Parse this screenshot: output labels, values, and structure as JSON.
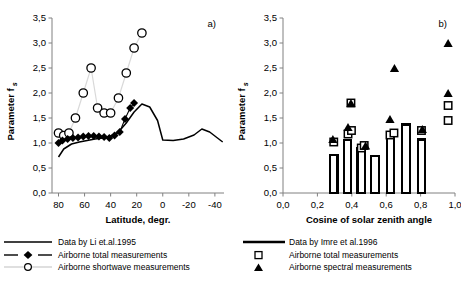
{
  "figure": {
    "panel_a_label": "a)",
    "panel_b_label": "b)"
  },
  "chart_data": [
    {
      "type": "scatter",
      "panel": "a)",
      "title": "",
      "xlabel": "Latitude, degr.",
      "ylabel": "Parameter f",
      "ylabel_sub": "s",
      "xlim": [
        85,
        -47
      ],
      "ylim": [
        0.0,
        3.5
      ],
      "xticks": [
        80,
        60,
        40,
        20,
        0,
        -20,
        -40
      ],
      "xticklabels": [
        "80",
        "60",
        "40",
        "20",
        "0",
        "-20",
        "-40"
      ],
      "yticks": [
        0.0,
        0.5,
        1.0,
        1.5,
        2.0,
        2.5,
        3.0,
        3.5
      ],
      "yticklabels": [
        "0,0",
        "0,5",
        "1,0",
        "1,5",
        "2,0",
        "2,5",
        "3,0",
        "3,5"
      ],
      "grid": false,
      "legend_position": "below",
      "series": [
        {
          "name": "Data by Li et.al.1995",
          "style": "line",
          "color": "#000000",
          "x": [
            80,
            76,
            70,
            64,
            58,
            52,
            46,
            40,
            34,
            28,
            22,
            16,
            10,
            4,
            0,
            -8,
            -16,
            -24,
            -30,
            -36,
            -42,
            -46
          ],
          "values": [
            0.72,
            0.88,
            0.98,
            1.02,
            1.05,
            1.08,
            1.1,
            1.14,
            1.22,
            1.4,
            1.62,
            1.78,
            1.72,
            1.45,
            1.06,
            1.05,
            1.08,
            1.16,
            1.28,
            1.22,
            1.1,
            1.02
          ]
        },
        {
          "name": "Airborne total measurements",
          "style": "line-diamond",
          "color": "#000000",
          "x": [
            80,
            77,
            73,
            69,
            65,
            61,
            57,
            53,
            49,
            45,
            41,
            37,
            33,
            29,
            25,
            22
          ],
          "values": [
            1.0,
            1.05,
            1.08,
            1.1,
            1.11,
            1.13,
            1.14,
            1.14,
            1.13,
            1.12,
            1.1,
            1.15,
            1.22,
            1.48,
            1.7,
            1.8
          ]
        },
        {
          "name": "Airborne shortwave measurements",
          "style": "line-circle",
          "color": "#bfbfbf",
          "x": [
            80,
            76,
            72,
            67,
            61,
            55,
            50,
            45,
            40,
            34,
            28,
            22
          ],
          "values": [
            1.2,
            1.15,
            1.2,
            1.5,
            2.0,
            2.5,
            1.7,
            1.6,
            1.6,
            1.9,
            2.4,
            2.9
          ]
        },
        {
          "name": "Airborne shortwave measurements (top point)",
          "style": "circle-only",
          "color": "#bfbfbf",
          "x": [
            16
          ],
          "values": [
            3.2
          ]
        }
      ]
    },
    {
      "type": "bar",
      "panel": "b)",
      "title": "",
      "xlabel": "Cosine of solar zenith angle",
      "ylabel": "Parameter f",
      "ylabel_sub": "s",
      "xlim": [
        0.0,
        1.0
      ],
      "ylim": [
        0.0,
        3.5
      ],
      "xticks": [
        0.0,
        0.2,
        0.4,
        0.6,
        0.8,
        1.0
      ],
      "xticklabels": [
        "0,0",
        "0,2",
        "0,4",
        "0,6",
        "0,8",
        "1,0"
      ],
      "yticks": [
        0.0,
        0.5,
        1.0,
        1.5,
        2.0,
        2.5,
        3.0,
        3.5
      ],
      "yticklabels": [
        "0,0",
        "0,5",
        "1,0",
        "1,5",
        "2,0",
        "2,5",
        "3,0",
        "3,5"
      ],
      "grid": false,
      "legend_position": "below",
      "bars": {
        "name": "Data by Imre et al.1996",
        "color": "#ffffff",
        "edge_color": "#000000",
        "x_centers": [
          0.295,
          0.375,
          0.455,
          0.535,
          0.625,
          0.715,
          0.805
        ],
        "width": 0.043,
        "values": [
          0.76,
          1.06,
          0.9,
          0.74,
          1.14,
          1.37,
          1.07
        ]
      },
      "series": [
        {
          "name": "Airborne total measurements",
          "style": "open-square",
          "color": "#ffffff",
          "edge_color": "#000000",
          "x": [
            0.295,
            0.378,
            0.398,
            0.455,
            0.472,
            0.395,
            0.622,
            0.645,
            0.805,
            0.96,
            0.96
          ],
          "values": [
            1.02,
            1.18,
            1.25,
            0.9,
            0.95,
            1.8,
            1.16,
            1.2,
            1.25,
            1.45,
            1.75
          ]
        },
        {
          "name": "Airborne spectral measurements",
          "style": "filled-triangle",
          "color": "#000000",
          "x": [
            0.29,
            0.378,
            0.48,
            0.395,
            0.622,
            0.648,
            0.81,
            0.96,
            0.96
          ],
          "values": [
            1.08,
            1.32,
            0.95,
            1.8,
            1.48,
            2.5,
            1.28,
            2.0,
            3.0
          ]
        }
      ],
      "legend": [
        {
          "key": "line",
          "label": "Data by Imre et al.1996"
        },
        {
          "key": "open-square",
          "label": "Airborne total measurements"
        },
        {
          "key": "filled-triangle",
          "label": "Airborne spectral measurements"
        }
      ]
    }
  ],
  "panel_a_legend": [
    {
      "key": "solid-line",
      "label": "Data by Li et.al.1995"
    },
    {
      "key": "dashed-diamond",
      "label": "Airborne total measurements"
    },
    {
      "key": "open-circle",
      "label": "Airborne shortwave measurements"
    }
  ],
  "panel_b_legend": [
    {
      "key": "thick-line",
      "label": "Data by Imre et al.1996"
    },
    {
      "key": "open-square",
      "label": "Airborne total measurements"
    },
    {
      "key": "filled-triangle",
      "label": "Airborne spectral measurements"
    }
  ]
}
